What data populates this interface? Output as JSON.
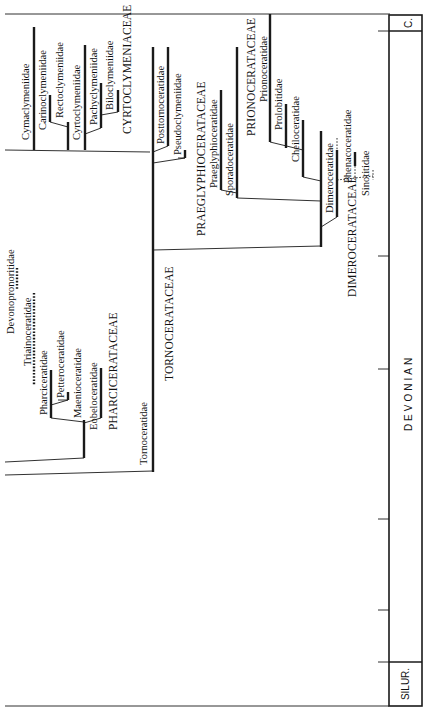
{
  "figure": {
    "type": "phylogenetic_tree",
    "orientation": "rotated_90_ccw"
  },
  "stratigraphy": {
    "top_unit": "C.",
    "main_unit": "DEVONIAN",
    "bottom_unit": "SILUR."
  },
  "superfamilies": {
    "cyrtoclymeniaceae": "CYRTOCLYMENIACEAE",
    "praeglyphioceratacaeae": "PRAEGLYPHIOCERATACEAE",
    "prionoceratacaeae": "PRIONOCERATACEAE",
    "dimeroceratacaeae": "DIMEROCERATACEAE",
    "pharciceratacaeae": "PHARCICERATACEAE",
    "tornoceratacaeae": "TORNOCERATACEAE"
  },
  "families": {
    "cymaclymeniidae": "Cymaclymeniidae",
    "carinoclymeniidae": "Carinoclymeniidae",
    "rectoclymeniidae": "Rectoclymeniidae",
    "cyrtoclymeniidae": "Cyrtoclymeniidae",
    "pachyclymeniidae": "Pachyclymeniidae",
    "biloclymeniidae": "Biloclymeniidae",
    "posttornoceratidae": "Posttornoceratidae",
    "pseudoclymeniidae": "Pseudoclymeniidae",
    "praeglyphioceratidae": "Praeglyphioceratidae",
    "sporadoceratidae": "Sporadoceratidae",
    "prionoceratidae": "Prionoceratidae",
    "prolobitidae": "Prolobitidae",
    "cheiloceratidae": "Cheiloceratidae",
    "dimeroceratidae": "Dimeroceratidae",
    "phenacoceratidae": "Phenacoceratidae",
    "sinotitidae": "Sinotitidae",
    "devonopronoritidae": "Devonopronoritidae",
    "triainoceratidae": "Triainoceratidae",
    "pharciceratidae": "Pharciceratidae",
    "petteroceratidae": "Petteroceratidae",
    "maenioceratidae": "Maenioceratidae",
    "eobeloceratidae": "Eobeloceratidae",
    "tornoceratidae": "Tornoceratidae"
  }
}
